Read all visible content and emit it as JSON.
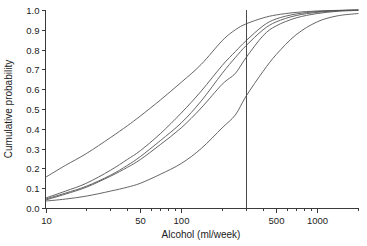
{
  "chart_data": {
    "type": "line",
    "title": "",
    "subtitle": "",
    "xlabel": "Alcohol (ml/week)",
    "ylabel": "Cumulative probability",
    "xscale": "log",
    "yscale": "linear",
    "xlim": [
      10,
      2000
    ],
    "ylim": [
      0.0,
      1.0
    ],
    "grid": false,
    "legend": "none",
    "x_tick_labels": [
      "10",
      "50",
      "100",
      "500",
      "1000"
    ],
    "x_tick_values": [
      10,
      50,
      100,
      500,
      1000
    ],
    "x_minor_ticks": [
      20,
      30,
      40,
      60,
      70,
      80,
      90,
      200,
      300,
      400,
      600,
      700,
      800,
      900,
      2000
    ],
    "y_tick_labels": [
      "0.0",
      "0.1",
      "0.2",
      "0.3",
      "0.4",
      "0.5",
      "0.6",
      "0.7",
      "0.8",
      "0.9",
      "1.0"
    ],
    "y_tick_values": [
      0.0,
      0.1,
      0.2,
      0.3,
      0.4,
      0.5,
      0.6,
      0.7,
      0.8,
      0.9,
      1.0
    ],
    "annotations": [
      {
        "name": "reference-line",
        "type": "vline",
        "x": 300,
        "label": ""
      }
    ],
    "series": [
      {
        "name": "curve-1",
        "x": [
          10,
          14,
          20,
          30,
          40,
          50,
          70,
          100,
          140,
          200,
          250,
          300,
          400,
          500,
          700,
          1000,
          1400,
          2000
        ],
        "values": [
          0.155,
          0.215,
          0.275,
          0.355,
          0.415,
          0.465,
          0.545,
          0.635,
          0.725,
          0.845,
          0.9,
          0.93,
          0.96,
          0.975,
          0.988,
          0.995,
          0.998,
          1.0
        ]
      },
      {
        "name": "curve-2",
        "x": [
          10,
          14,
          20,
          30,
          40,
          50,
          70,
          100,
          140,
          200,
          250,
          300,
          400,
          500,
          700,
          1000,
          1400,
          2000
        ],
        "values": [
          0.05,
          0.085,
          0.125,
          0.19,
          0.245,
          0.29,
          0.375,
          0.48,
          0.59,
          0.72,
          0.79,
          0.845,
          0.92,
          0.955,
          0.98,
          0.992,
          0.997,
          1.0
        ]
      },
      {
        "name": "curve-3",
        "x": [
          10,
          14,
          20,
          30,
          40,
          50,
          70,
          100,
          140,
          200,
          250,
          300,
          400,
          500,
          700,
          1000,
          1400,
          2000
        ],
        "values": [
          0.045,
          0.075,
          0.11,
          0.165,
          0.215,
          0.26,
          0.34,
          0.43,
          0.54,
          0.68,
          0.76,
          0.82,
          0.9,
          0.94,
          0.972,
          0.988,
          0.996,
          1.0
        ]
      },
      {
        "name": "curve-4",
        "x": [
          10,
          14,
          20,
          30,
          40,
          50,
          70,
          100,
          140,
          200,
          250,
          300,
          400,
          500,
          700,
          1000,
          1400,
          2000
        ],
        "values": [
          0.04,
          0.07,
          0.105,
          0.16,
          0.205,
          0.245,
          0.32,
          0.405,
          0.505,
          0.625,
          0.68,
          0.76,
          0.87,
          0.92,
          0.96,
          0.982,
          0.993,
          0.998
        ]
      },
      {
        "name": "curve-5",
        "x": [
          10,
          14,
          20,
          30,
          40,
          50,
          70,
          100,
          140,
          200,
          250,
          300,
          400,
          500,
          700,
          1000,
          1400,
          2000
        ],
        "values": [
          0.035,
          0.045,
          0.06,
          0.085,
          0.105,
          0.125,
          0.17,
          0.225,
          0.3,
          0.405,
          0.47,
          0.565,
          0.69,
          0.775,
          0.875,
          0.94,
          0.97,
          0.982
        ]
      }
    ]
  },
  "figure": {
    "colors": {
      "curve": "#545454",
      "axis": "#3a3a3a",
      "refline": "#4a4a4a",
      "text": "#1c1c1c",
      "background": "#ffffff"
    }
  }
}
